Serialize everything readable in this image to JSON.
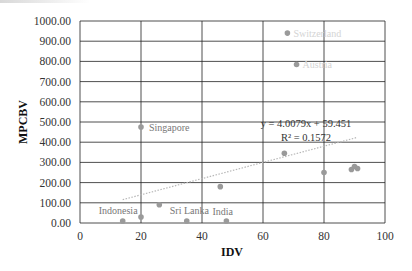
{
  "chart_data": {
    "type": "scatter",
    "title": "",
    "xlabel": "IDV",
    "ylabel": "MPCBV",
    "xlim": [
      0,
      100
    ],
    "ylim": [
      0,
      1000
    ],
    "x_ticks": [
      "0",
      "20",
      "40",
      "60",
      "80",
      "100"
    ],
    "y_ticks": [
      "0.00",
      "100.00",
      "200.00",
      "300.00",
      "400.00",
      "500.00",
      "600.00",
      "700.00",
      "800.00",
      "900.00",
      "1000.00"
    ],
    "grid": true,
    "legend": "none",
    "points": [
      {
        "label": "Switzerland",
        "x": 68,
        "y": 940
      },
      {
        "label": "Austria",
        "x": 71,
        "y": 785
      },
      {
        "label": "Singapore",
        "x": 20,
        "y": 475
      },
      {
        "label": "",
        "x": 67,
        "y": 345
      },
      {
        "label": "",
        "x": 80,
        "y": 250
      },
      {
        "label": "",
        "x": 89,
        "y": 265
      },
      {
        "label": "",
        "x": 90,
        "y": 280
      },
      {
        "label": "",
        "x": 91,
        "y": 270
      },
      {
        "label": "",
        "x": 46,
        "y": 180
      },
      {
        "label": "",
        "x": 26,
        "y": 90
      },
      {
        "label": "",
        "x": 20,
        "y": 30
      },
      {
        "label": "Indonesia",
        "x": 14,
        "y": 10
      },
      {
        "label": "Sri Lanka",
        "x": 35,
        "y": 10
      },
      {
        "label": "India",
        "x": 48,
        "y": 10
      }
    ],
    "trendline": {
      "type": "linear",
      "slope": 4.0079,
      "intercept": 59.451,
      "equation": "y = 4.0079x + 59.451",
      "r_squared": "R² = 0.1572",
      "style": "dotted"
    },
    "colors": {
      "marker": "#9a9a9a",
      "trendline": "#b0b0b0",
      "grid": "#222222"
    }
  }
}
